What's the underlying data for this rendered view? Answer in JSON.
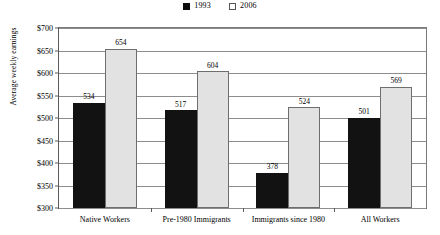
{
  "chart_data": {
    "type": "bar",
    "title": "",
    "xlabel": "",
    "ylabel": "Average weekly earnings",
    "ylim": [
      300,
      700
    ],
    "ytick_step": 50,
    "ytick_labels": [
      "$700",
      "$650",
      "$600",
      "$550",
      "$500",
      "$450",
      "$400",
      "$350",
      "$300"
    ],
    "ytick_values": [
      700,
      650,
      600,
      550,
      500,
      450,
      400,
      350,
      300
    ],
    "grid": true,
    "legend_position": "top-center",
    "categories": [
      "Native Workers",
      "Pre-1980 Immigrants",
      "Immigrants since 1980",
      "All Workers"
    ],
    "series": [
      {
        "name": "1993",
        "color": "#121212",
        "values": [
          534,
          517,
          378,
          501
        ],
        "labels": [
          "534",
          "517",
          "378",
          "501"
        ]
      },
      {
        "name": "2006",
        "color": "#e2e2e2",
        "values": [
          654,
          604,
          524,
          569
        ],
        "labels": [
          "654",
          "604",
          "524",
          "569"
        ]
      }
    ]
  },
  "legend": {
    "entries": [
      {
        "label": "1993"
      },
      {
        "label": "2006"
      }
    ]
  },
  "axis": {
    "y_title": "Average weekly earnings"
  }
}
